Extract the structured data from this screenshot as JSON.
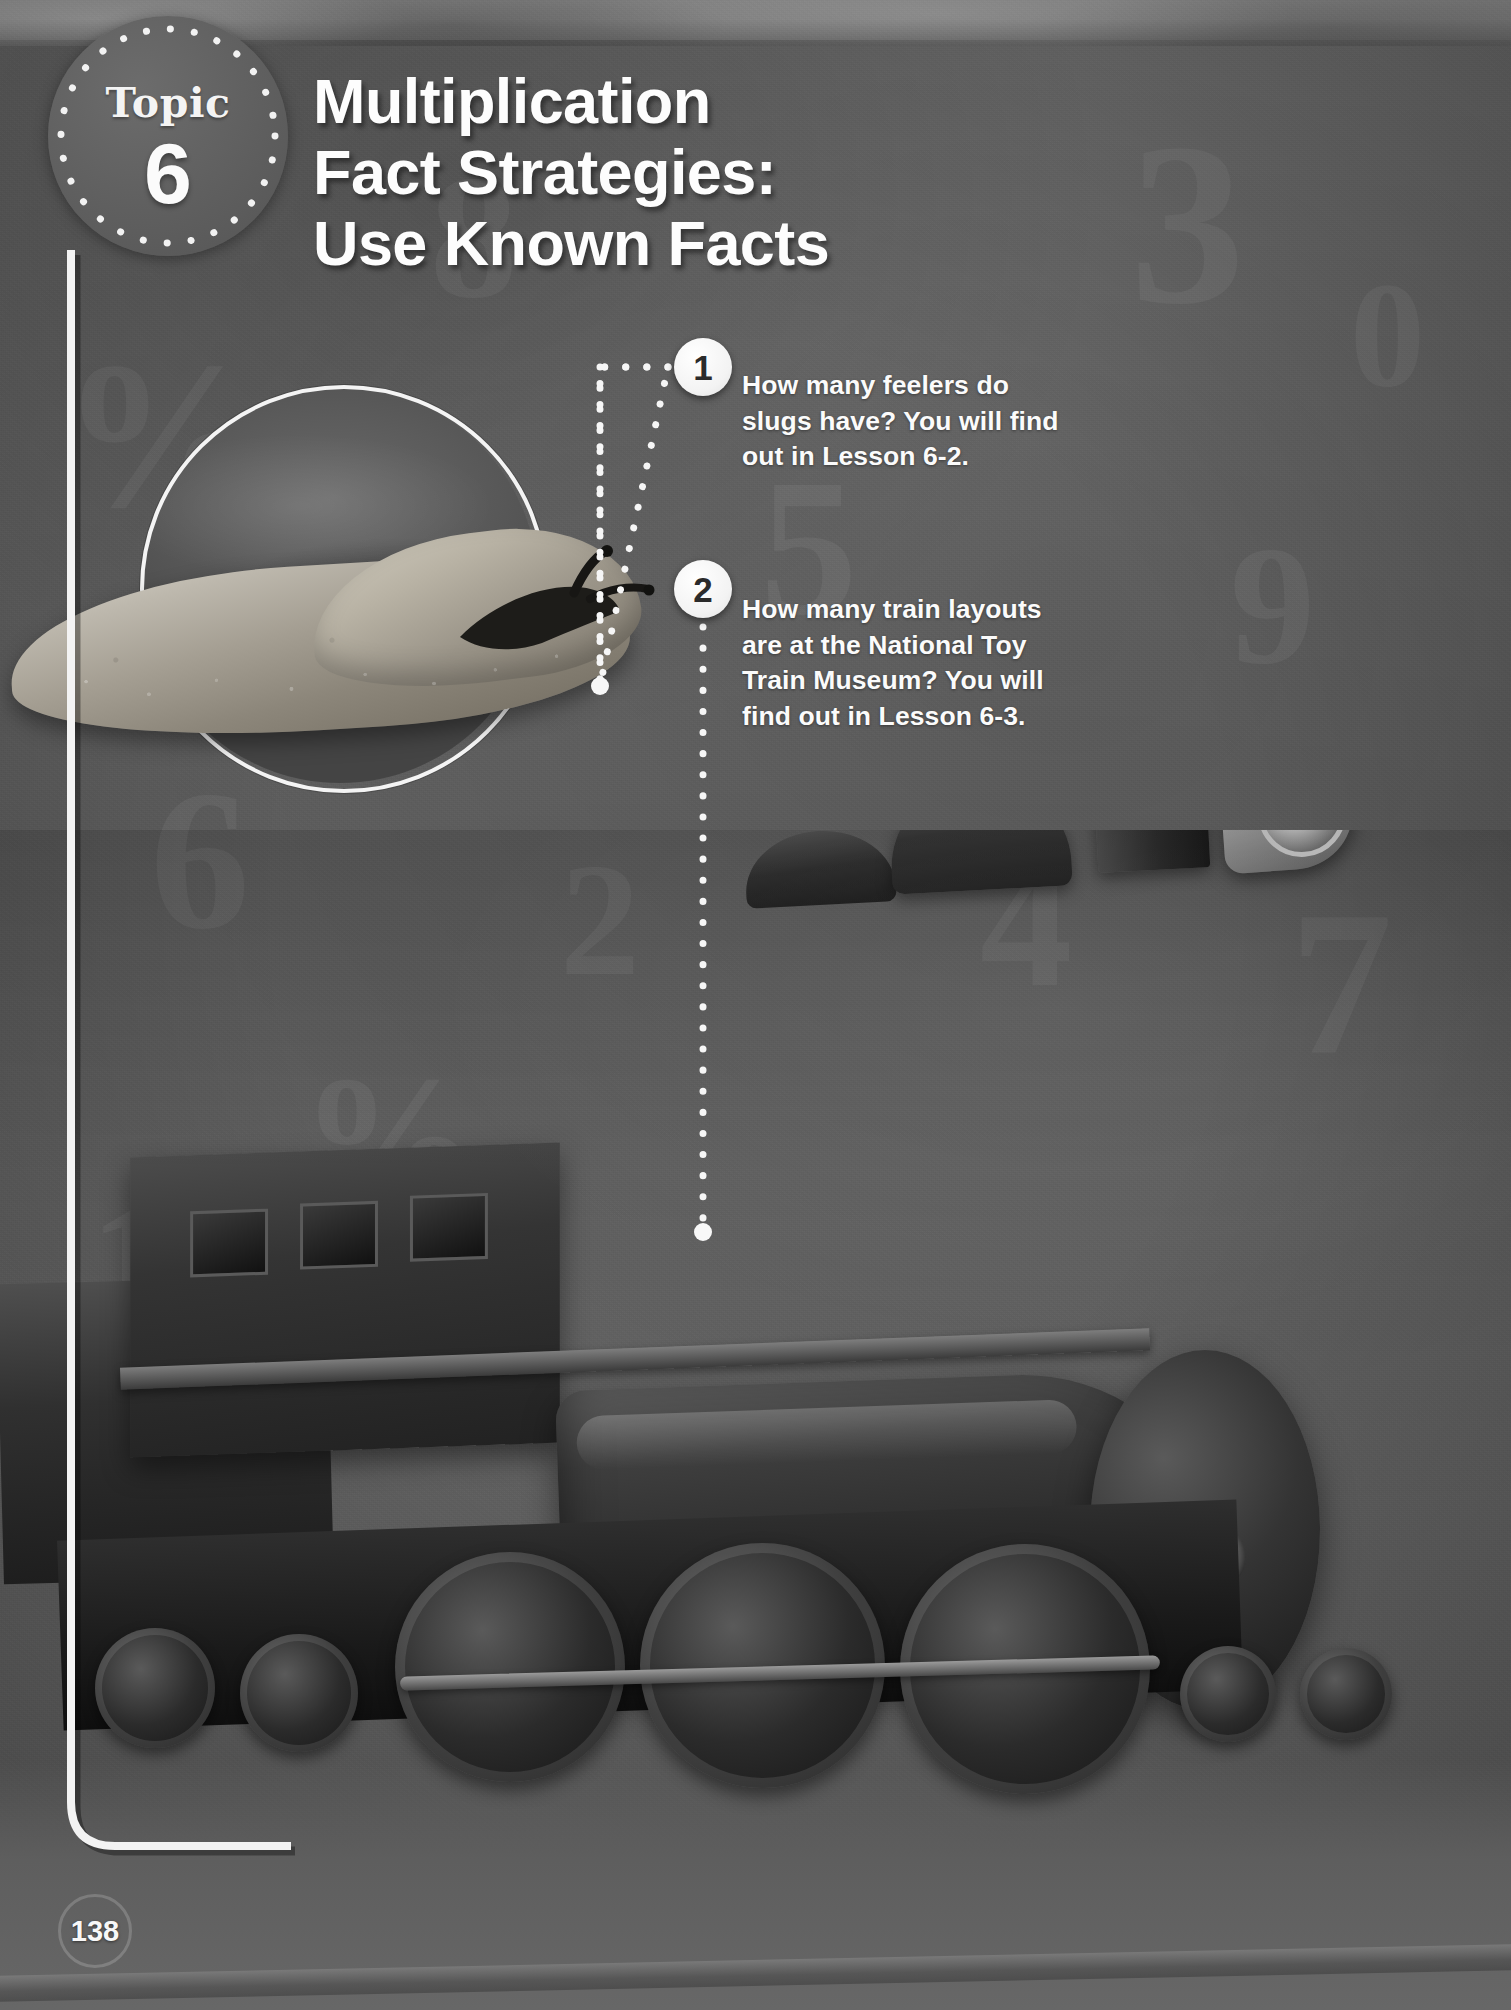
{
  "page": {
    "number": "138",
    "background_color": "#6b6b6b",
    "accent_color": "#f4f4f4"
  },
  "topic_badge": {
    "label": "Topic",
    "number": "6",
    "icon": "dotted-ring"
  },
  "title": {
    "line1": "Multiplication",
    "line2": "Fact Strategies:",
    "line3": "Use Known Facts"
  },
  "callouts": [
    {
      "number": "1",
      "text": "How many feelers do slugs have? You will find out in Lesson 6-2.",
      "connector": "dotted-elbow"
    },
    {
      "number": "2",
      "text": "How many train layouts are at the National Toy Train Museum? You will find out in Lesson 6-3.",
      "connector": "dotted-vertical"
    }
  ],
  "photos": {
    "slug": "slug-photo",
    "locomotive": "steam-locomotive-photo"
  },
  "watermarks": [
    "%",
    "8",
    "5",
    "3",
    "9",
    "6",
    "2",
    "4",
    "7",
    "%",
    "1",
    "0"
  ]
}
